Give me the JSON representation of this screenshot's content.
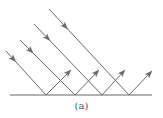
{
  "diagram": {
    "caption": "(a)",
    "surface": {
      "x1": 10,
      "x2": 152,
      "y": 95,
      "color": "#666666"
    },
    "ray_color": "#6a6a6a",
    "rays": [
      {
        "start": [
          6,
          51
        ],
        "hit": [
          46,
          95
        ],
        "end": [
          70,
          71
        ]
      },
      {
        "start": [
          20,
          40
        ],
        "hit": [
          75,
          95
        ],
        "end": [
          98,
          71
        ]
      },
      {
        "start": [
          34,
          24
        ],
        "hit": [
          102,
          95
        ],
        "end": [
          124,
          71
        ]
      },
      {
        "start": [
          49,
          9
        ],
        "hit": [
          129,
          95
        ],
        "end": [
          151,
          72
        ]
      }
    ]
  }
}
